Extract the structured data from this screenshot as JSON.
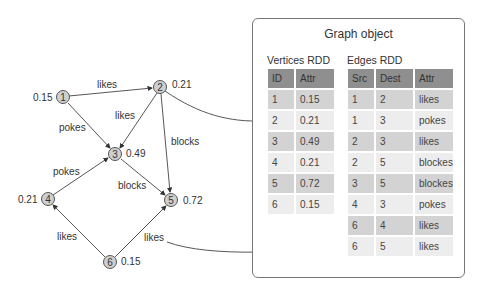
{
  "graph": {
    "nodes": [
      {
        "id": "1",
        "value": "0.15"
      },
      {
        "id": "2",
        "value": "0.21"
      },
      {
        "id": "3",
        "value": "0.49"
      },
      {
        "id": "4",
        "value": "0.21"
      },
      {
        "id": "5",
        "value": "0.72"
      },
      {
        "id": "6",
        "value": "0.15"
      }
    ],
    "edges": [
      {
        "label": "likes"
      },
      {
        "label": "pokes"
      },
      {
        "label": "likes"
      },
      {
        "label": "blocks"
      },
      {
        "label": "blocks"
      },
      {
        "label": "pokes"
      },
      {
        "label": "likes"
      },
      {
        "label": "likes"
      }
    ]
  },
  "panel": {
    "title": "Graph object",
    "vertices": {
      "caption": "Vertices RDD",
      "headers": [
        "ID",
        "Attr"
      ],
      "rows": [
        [
          "1",
          "0.15"
        ],
        [
          "2",
          "0.21"
        ],
        [
          "3",
          "0.49"
        ],
        [
          "4",
          "0.21"
        ],
        [
          "5",
          "0.72"
        ],
        [
          "6",
          "0.15"
        ]
      ]
    },
    "edges": {
      "caption": "Edges RDD",
      "headers": [
        "Src",
        "Dest",
        "Attr"
      ],
      "rows": [
        [
          "1",
          "2",
          "likes"
        ],
        [
          "1",
          "3",
          "pokes"
        ],
        [
          "2",
          "3",
          "likes"
        ],
        [
          "2",
          "5",
          "blockes"
        ],
        [
          "3",
          "5",
          "blockes"
        ],
        [
          "4",
          "3",
          "pokes"
        ],
        [
          "6",
          "4",
          "likes"
        ],
        [
          "6",
          "5",
          "likes"
        ]
      ]
    }
  },
  "colors": {
    "header": "#8f8f8f",
    "row_dark": "#d3d3d3",
    "row_light": "#ededed",
    "node_fill": "#cfcfcf"
  }
}
